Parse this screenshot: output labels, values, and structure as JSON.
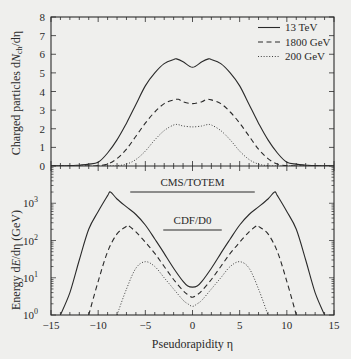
{
  "figure": {
    "background": "#efefed",
    "ink": "#2a2a2a"
  },
  "chart_data": [
    {
      "panel": "top",
      "type": "line",
      "title": "",
      "xlabel": "Pseudorapidity η",
      "ylabel": "Charged particles dN_ch/dη",
      "ylabel_parts": {
        "prefix": "Charged particles d",
        "italic": "N",
        "sub": "ch",
        "suffix": "/dη"
      },
      "xlim": [
        -15,
        15
      ],
      "ylim": [
        0,
        8
      ],
      "yscale": "linear",
      "yticks": [
        0,
        1,
        2,
        3,
        4,
        5,
        6,
        7,
        8
      ],
      "xticks": [
        -15,
        -10,
        -5,
        0,
        5,
        10,
        15
      ],
      "grid": false,
      "legend_position": "upper right",
      "legend": [
        {
          "label": "13 TeV",
          "style": "solid"
        },
        {
          "label": "1800 GeV",
          "style": "dashed"
        },
        {
          "label": "200 GeV",
          "style": "dotted"
        }
      ],
      "series": [
        {
          "name": "13 TeV",
          "style": "solid",
          "x": [
            -15,
            -13,
            -12,
            -11,
            -10,
            -9,
            -8,
            -7,
            -6,
            -5,
            -4,
            -3,
            -2,
            -1.7,
            -1,
            0,
            1,
            1.7,
            2,
            3,
            4,
            5,
            6,
            7,
            8,
            9,
            10,
            11,
            12,
            13,
            15
          ],
          "y": [
            0,
            0.02,
            0.05,
            0.1,
            0.2,
            0.7,
            1.4,
            2.3,
            3.3,
            4.3,
            5.0,
            5.5,
            5.72,
            5.75,
            5.6,
            5.3,
            5.6,
            5.75,
            5.72,
            5.5,
            5.0,
            4.3,
            3.3,
            2.3,
            1.4,
            0.7,
            0.2,
            0.1,
            0.05,
            0.02,
            0
          ]
        },
        {
          "name": "1800 GeV",
          "style": "dashed",
          "x": [
            -15,
            -11,
            -10,
            -9,
            -8,
            -7,
            -6,
            -5,
            -4,
            -3,
            -2,
            -1.5,
            -1,
            0,
            1,
            1.5,
            2,
            3,
            4,
            5,
            6,
            7,
            8,
            9,
            10,
            11,
            15
          ],
          "y": [
            0,
            0,
            0.02,
            0.1,
            0.4,
            0.9,
            1.6,
            2.3,
            2.9,
            3.35,
            3.55,
            3.58,
            3.45,
            3.35,
            3.45,
            3.58,
            3.55,
            3.35,
            2.9,
            2.3,
            1.6,
            0.9,
            0.4,
            0.1,
            0.02,
            0,
            0
          ]
        },
        {
          "name": "200 GeV",
          "style": "dotted",
          "x": [
            -15,
            -9,
            -8,
            -7,
            -6,
            -5,
            -4,
            -3,
            -2,
            -1.5,
            -1,
            0,
            1,
            1.5,
            2,
            3,
            4,
            5,
            6,
            7,
            8,
            9,
            15
          ],
          "y": [
            0,
            0,
            0.02,
            0.1,
            0.35,
            0.8,
            1.4,
            1.9,
            2.2,
            2.22,
            2.15,
            2.1,
            2.15,
            2.22,
            2.2,
            1.9,
            1.4,
            0.8,
            0.35,
            0.1,
            0.02,
            0,
            0
          ]
        }
      ]
    },
    {
      "panel": "bottom",
      "type": "line",
      "title": "",
      "xlabel": "Pseudorapidity η",
      "ylabel": "Energy dE/dη (GeV)",
      "ylabel_parts": {
        "prefix": "Energy d",
        "italic": "E",
        "suffix": "/dη (GeV)"
      },
      "xlim": [
        -15,
        15
      ],
      "ylim": [
        1,
        10000
      ],
      "yscale": "log",
      "yticks": [
        "10^0",
        "10^1",
        "10^2",
        "10^3"
      ],
      "xticks": [
        -15,
        -10,
        -5,
        0,
        5,
        10,
        15
      ],
      "grid": false,
      "annotations": [
        {
          "text": "CMS/TOTEM",
          "x_range": [
            -6.6,
            6.6
          ],
          "y": 2000
        },
        {
          "text": "CDF/D0",
          "x_range": [
            -3.1,
            3.1
          ],
          "y": 200
        }
      ],
      "series": [
        {
          "name": "13 TeV",
          "style": "solid",
          "x": [
            -14,
            -13,
            -12,
            -11,
            -10,
            -9,
            -8.7,
            -8,
            -7,
            -6,
            -5,
            -4,
            -3,
            -2,
            -1,
            -0.5,
            0,
            0.5,
            1,
            2,
            3,
            4,
            5,
            6,
            7,
            8,
            8.7,
            9,
            10,
            11,
            12,
            13,
            14
          ],
          "y": [
            1,
            4,
            30,
            200,
            600,
            1600,
            2000,
            1300,
            800,
            500,
            260,
            110,
            45,
            18,
            8,
            6,
            5.6,
            6,
            8,
            18,
            45,
            110,
            260,
            500,
            800,
            1300,
            2000,
            1600,
            600,
            200,
            30,
            4,
            1
          ]
        },
        {
          "name": "1800 GeV",
          "style": "dashed",
          "x": [
            -11,
            -10,
            -9,
            -8,
            -7,
            -6.8,
            -6,
            -5,
            -4,
            -3,
            -2,
            -1,
            -0.5,
            0,
            0.5,
            1,
            2,
            3,
            4,
            5,
            6,
            6.8,
            7,
            8,
            9,
            10,
            11
          ],
          "y": [
            1,
            8,
            50,
            150,
            240,
            250,
            170,
            90,
            45,
            20,
            9,
            4.5,
            3.5,
            3.0,
            3.5,
            4.5,
            9,
            20,
            45,
            90,
            170,
            250,
            240,
            150,
            50,
            8,
            1
          ]
        },
        {
          "name": "200 GeV",
          "style": "dotted",
          "x": [
            -8,
            -7,
            -6,
            -5,
            -4,
            -3,
            -2,
            -1,
            -0.5,
            0,
            0.5,
            1,
            2,
            3,
            4,
            5,
            6,
            7,
            8
          ],
          "y": [
            1,
            5,
            18,
            27,
            20,
            10,
            5,
            2.5,
            2.0,
            1.7,
            2.0,
            2.5,
            5,
            10,
            20,
            27,
            18,
            5,
            1
          ]
        }
      ]
    }
  ]
}
